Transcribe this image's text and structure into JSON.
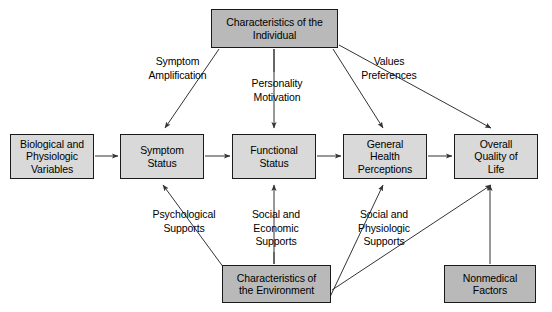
{
  "diagram": {
    "type": "flow-diagram",
    "canvas": {
      "width": 552,
      "height": 312
    },
    "colors": {
      "node_fill_light": "#d9d9d9",
      "node_fill_dark": "#b9b9b9",
      "node_border": "#1a1a1a",
      "text": "#000000",
      "background": "#ffffff",
      "arrow": "#333333"
    },
    "nodes": [
      {
        "id": "characteristics-individual",
        "label": "Characteristics of the\nIndividual",
        "shade": "dark",
        "x": 211,
        "y": 9,
        "w": 127,
        "h": 39
      },
      {
        "id": "biological-physiologic-variables",
        "label": "Biological and\nPhysiologic\nVariables",
        "shade": "light",
        "x": 10,
        "y": 134,
        "w": 84,
        "h": 45
      },
      {
        "id": "symptom-status",
        "label": "Symptom\nStatus",
        "shade": "light",
        "x": 120,
        "y": 134,
        "w": 84,
        "h": 45
      },
      {
        "id": "functional-status",
        "label": "Functional\nStatus",
        "shade": "light",
        "x": 232,
        "y": 134,
        "w": 84,
        "h": 45
      },
      {
        "id": "general-health-perceptions",
        "label": "General\nHealth\nPerceptions",
        "shade": "light",
        "x": 343,
        "y": 134,
        "w": 84,
        "h": 45
      },
      {
        "id": "overall-quality-of-life",
        "label": "Overall\nQuality of\nLife",
        "shade": "light",
        "x": 454,
        "y": 134,
        "w": 84,
        "h": 45
      },
      {
        "id": "characteristics-environment",
        "label": "Characteristics of\nthe Environment",
        "shade": "dark",
        "x": 222,
        "y": 265,
        "w": 109,
        "h": 38
      },
      {
        "id": "nonmedical-factors",
        "label": "Nonmedical\nFactors",
        "shade": "dark",
        "x": 444,
        "y": 265,
        "w": 92,
        "h": 38
      }
    ],
    "edge_labels": [
      {
        "id": "symptom-amplification",
        "label": "Symptom\nAmplification",
        "x": 129,
        "y": 55,
        "w": 97
      },
      {
        "id": "personality-motivation",
        "label": "Personality\nMotivation",
        "x": 235,
        "y": 77,
        "w": 84
      },
      {
        "id": "values-preferences",
        "label": "Values\nPreferences",
        "x": 347,
        "y": 55,
        "w": 84
      },
      {
        "id": "psychological-supports",
        "label": "Psychological\nSupports",
        "x": 138,
        "y": 208,
        "w": 92
      },
      {
        "id": "social-economic-supports",
        "label": "Social and\nEconomic\nSupports",
        "x": 240,
        "y": 208,
        "w": 72
      },
      {
        "id": "social-physiologic-supports",
        "label": "Social and\nPhysiologic\nSupports",
        "x": 348,
        "y": 208,
        "w": 72
      }
    ],
    "edges": [
      {
        "id": "bio-to-symptom",
        "from": "biological-physiologic-variables",
        "to": "symptom-status",
        "style": "straight-horizontal"
      },
      {
        "id": "symptom-to-functional",
        "from": "symptom-status",
        "to": "functional-status",
        "style": "straight-horizontal"
      },
      {
        "id": "functional-to-perceptions",
        "from": "functional-status",
        "to": "general-health-perceptions",
        "style": "straight-horizontal"
      },
      {
        "id": "perceptions-to-quality",
        "from": "general-health-perceptions",
        "to": "overall-quality-of-life",
        "style": "straight-horizontal"
      },
      {
        "id": "individual-to-symptom",
        "from": "characteristics-individual",
        "to": "symptom-status",
        "style": "diagonal"
      },
      {
        "id": "individual-to-functional",
        "from": "characteristics-individual",
        "to": "functional-status",
        "style": "vertical"
      },
      {
        "id": "individual-to-perceptions",
        "from": "characteristics-individual",
        "to": "general-health-perceptions",
        "style": "diagonal"
      },
      {
        "id": "individual-to-quality",
        "from": "characteristics-individual",
        "to": "overall-quality-of-life",
        "style": "diagonal"
      },
      {
        "id": "environment-to-symptom",
        "from": "characteristics-environment",
        "to": "symptom-status",
        "style": "diagonal"
      },
      {
        "id": "environment-to-functional",
        "from": "characteristics-environment",
        "to": "functional-status",
        "style": "vertical"
      },
      {
        "id": "environment-to-perceptions",
        "from": "characteristics-environment",
        "to": "general-health-perceptions",
        "style": "diagonal"
      },
      {
        "id": "environment-to-quality",
        "from": "characteristics-environment",
        "to": "overall-quality-of-life",
        "style": "diagonal"
      },
      {
        "id": "nonmedical-to-quality",
        "from": "nonmedical-factors",
        "to": "overall-quality-of-life",
        "style": "vertical"
      }
    ]
  }
}
